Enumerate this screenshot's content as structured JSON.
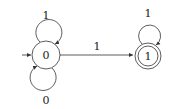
{
  "diagram": {
    "type": "finite-automaton",
    "states": [
      {
        "id": "q0",
        "label": "0",
        "initial": true,
        "accepting": false
      },
      {
        "id": "q1",
        "label": "1",
        "initial": false,
        "accepting": true
      }
    ],
    "transitions": [
      {
        "from": "q0",
        "to": "q0",
        "label": "1",
        "position": "top-loop"
      },
      {
        "from": "q0",
        "to": "q0",
        "label": "0",
        "position": "bottom-loop"
      },
      {
        "from": "q0",
        "to": "q1",
        "label": "1",
        "position": "edge"
      },
      {
        "from": "q1",
        "to": "q1",
        "label": "1",
        "position": "top-loop"
      }
    ],
    "colors": {
      "stroke": "#333333",
      "background": "#ffffff"
    }
  }
}
